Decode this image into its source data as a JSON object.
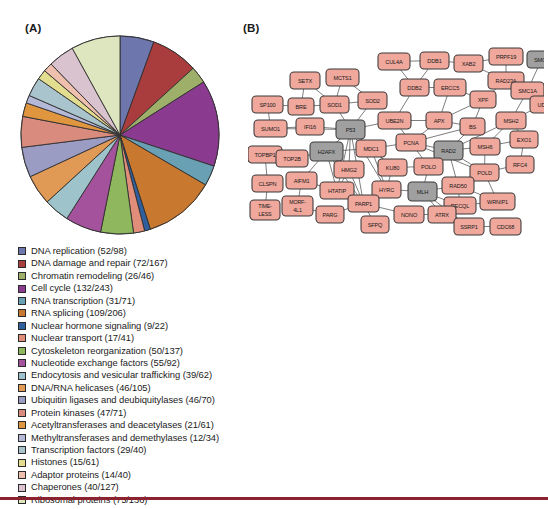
{
  "figure": {
    "panel_a_label": "(A)",
    "panel_b_label": "(B)"
  },
  "chart_data": {
    "type": "pie",
    "title": "",
    "legend_position": "below",
    "categories": [
      "DNA replication (52/98)",
      "DNA damage and repair (72/167)",
      "Chromatin remodeling (26/46)",
      "Cell cycle (132/243)",
      "RNA transcription (31/71)",
      "RNA splicing (109/206)",
      "Nuclear hormone signaling (9/22)",
      "Nuclear transport (17/41)",
      "Cytoskeleton reorganization (50/137)",
      "Nucleotide exchange factors (55/92)",
      "Endocytosis and vesicular trafficking (39/62)",
      "DNA/RNA helicases (46/105)",
      "Ubiquitin ligases and deubiquitylases (46/70)",
      "Protein kinases (47/71)",
      "Acetyltransferases and deacetylases (21/61)",
      "Methyltransferases and demethylases (12/34)",
      "Transcription factors (29/40)",
      "Histones (15/61)",
      "Adaptor proteins (14/40)",
      "Chaperones (40/127)",
      "Ribosomal proteins (75/136)"
    ],
    "values": [
      52,
      72,
      26,
      132,
      31,
      109,
      9,
      17,
      50,
      55,
      39,
      46,
      46,
      47,
      21,
      12,
      29,
      15,
      14,
      40,
      75
    ],
    "totals": [
      98,
      167,
      46,
      243,
      71,
      206,
      22,
      41,
      137,
      92,
      62,
      105,
      70,
      71,
      61,
      34,
      40,
      61,
      40,
      127,
      136
    ],
    "colors": [
      "#6e76ae",
      "#a93c3c",
      "#9eaf69",
      "#8a3b8f",
      "#6aa0b4",
      "#c8792f",
      "#2f5f9e",
      "#e08e7a",
      "#8fb85e",
      "#a3529b",
      "#9ec3ca",
      "#e09a55",
      "#9a9cc4",
      "#d98c7e",
      "#e0953f",
      "#b5b9d8",
      "#a9c4cc",
      "#e3dd90",
      "#efc0ae",
      "#d9c3cf",
      "#dde6be"
    ],
    "xlabel": "",
    "ylabel": ""
  },
  "network": {
    "nodes": [
      {
        "id": "SETX",
        "label": "SETX",
        "x": 42,
        "y": 38,
        "w": 30,
        "h": 17,
        "color": "pink"
      },
      {
        "id": "MCTS1",
        "label": "MCTS1",
        "x": 78,
        "y": 35,
        "w": 33,
        "h": 17,
        "color": "pink"
      },
      {
        "id": "CUL4A",
        "label": "CUL4A",
        "x": 130,
        "y": 19,
        "w": 32,
        "h": 17,
        "color": "pink"
      },
      {
        "id": "DDB1",
        "label": "DDB1",
        "x": 172,
        "y": 18,
        "w": 29,
        "h": 17,
        "color": "pink"
      },
      {
        "id": "XAB2",
        "label": "XAB2",
        "x": 206,
        "y": 21,
        "w": 29,
        "h": 17,
        "color": "pink"
      },
      {
        "id": "PRPF19",
        "label": "PRPF19",
        "x": 241,
        "y": 14,
        "w": 34,
        "h": 17,
        "color": "pink"
      },
      {
        "id": "SMC3",
        "label": "SMC3",
        "x": 279,
        "y": 17,
        "w": 29,
        "h": 17,
        "color": "gray"
      },
      {
        "id": "SP100",
        "label": "SP100",
        "x": 4,
        "y": 62,
        "w": 31,
        "h": 17,
        "color": "pink"
      },
      {
        "id": "BRE",
        "label": "BRE",
        "x": 40,
        "y": 64,
        "w": 26,
        "h": 17,
        "color": "pink"
      },
      {
        "id": "SOD1",
        "label": "SOD1",
        "x": 72,
        "y": 62,
        "w": 29,
        "h": 17,
        "color": "pink"
      },
      {
        "id": "SOD2",
        "label": "SOD2",
        "x": 110,
        "y": 58,
        "w": 29,
        "h": 17,
        "color": "pink"
      },
      {
        "id": "DDB2",
        "label": "DDB2",
        "x": 152,
        "y": 45,
        "w": 29,
        "h": 17,
        "color": "pink"
      },
      {
        "id": "ERCC5",
        "label": "ERCC5",
        "x": 186,
        "y": 45,
        "w": 32,
        "h": 17,
        "color": "pink"
      },
      {
        "id": "XPF",
        "label": "XPF",
        "x": 222,
        "y": 57,
        "w": 26,
        "h": 17,
        "color": "pink"
      },
      {
        "id": "RAD23A",
        "label": "RAD23A",
        "x": 240,
        "y": 38,
        "w": 36,
        "h": 17,
        "color": "pink"
      },
      {
        "id": "SMC1A",
        "label": "SMC1A",
        "x": 263,
        "y": 48,
        "w": 33,
        "h": 17,
        "color": "pink"
      },
      {
        "id": "UDG",
        "label": "UDG",
        "x": 282,
        "y": 62,
        "w": 27,
        "h": 17,
        "color": "pink"
      },
      {
        "id": "SUMO1",
        "label": "SUMO1",
        "x": 6,
        "y": 86,
        "w": 33,
        "h": 17,
        "color": "pink"
      },
      {
        "id": "IFI16",
        "label": "IFI16",
        "x": 48,
        "y": 84,
        "w": 28,
        "h": 17,
        "color": "pink"
      },
      {
        "id": "P53",
        "label": "P53",
        "x": 88,
        "y": 86,
        "w": 29,
        "h": 19,
        "color": "gray"
      },
      {
        "id": "UBE2N",
        "label": "UBE2N",
        "x": 130,
        "y": 78,
        "w": 33,
        "h": 17,
        "color": "pink"
      },
      {
        "id": "APX",
        "label": "APX",
        "x": 178,
        "y": 78,
        "w": 26,
        "h": 17,
        "color": "pink"
      },
      {
        "id": "BS",
        "label": "BS",
        "x": 212,
        "y": 84,
        "w": 25,
        "h": 17,
        "color": "pink"
      },
      {
        "id": "MSH2",
        "label": "MSH2",
        "x": 248,
        "y": 78,
        "w": 30,
        "h": 17,
        "color": "pink"
      },
      {
        "id": "TOPBP1",
        "label": "TOPBP1",
        "x": 0,
        "y": 112,
        "w": 34,
        "h": 17,
        "color": "pink"
      },
      {
        "id": "TOP2B",
        "label": "TOP2B",
        "x": 28,
        "y": 116,
        "w": 32,
        "h": 17,
        "color": "pink"
      },
      {
        "id": "H2AFX",
        "label": "H2AFX",
        "x": 62,
        "y": 108,
        "w": 33,
        "h": 19,
        "color": "gray"
      },
      {
        "id": "MDC1",
        "label": "MDC1",
        "x": 108,
        "y": 106,
        "w": 30,
        "h": 17,
        "color": "pink"
      },
      {
        "id": "PCNA",
        "label": "PCNA",
        "x": 148,
        "y": 100,
        "w": 30,
        "h": 17,
        "color": "pink"
      },
      {
        "id": "RAD2",
        "label": "RAD2",
        "x": 186,
        "y": 107,
        "w": 29,
        "h": 19,
        "color": "gray"
      },
      {
        "id": "MSH6",
        "label": "MSH6",
        "x": 222,
        "y": 104,
        "w": 30,
        "h": 17,
        "color": "pink"
      },
      {
        "id": "EXO1",
        "label": "EXO1",
        "x": 262,
        "y": 97,
        "w": 28,
        "h": 17,
        "color": "pink"
      },
      {
        "id": "RFC4",
        "label": "RFC4",
        "x": 258,
        "y": 122,
        "w": 28,
        "h": 17,
        "color": "pink"
      },
      {
        "id": "HMG2",
        "label": "HMG2",
        "x": 86,
        "y": 127,
        "w": 30,
        "h": 17,
        "color": "pink"
      },
      {
        "id": "KU80",
        "label": "KU80",
        "x": 130,
        "y": 125,
        "w": 29,
        "h": 17,
        "color": "pink"
      },
      {
        "id": "POLO",
        "label": "POLO",
        "x": 166,
        "y": 124,
        "w": 29,
        "h": 17,
        "color": "pink"
      },
      {
        "id": "POLD",
        "label": "POLD",
        "x": 222,
        "y": 130,
        "w": 29,
        "h": 17,
        "color": "pink"
      },
      {
        "id": "CLSPN",
        "label": "CLSPN",
        "x": 4,
        "y": 141,
        "w": 31,
        "h": 17,
        "color": "pink"
      },
      {
        "id": "AIFM1",
        "label": "AIFM1",
        "x": 38,
        "y": 138,
        "w": 31,
        "h": 17,
        "color": "pink"
      },
      {
        "id": "HTATIP",
        "label": "HTATIP",
        "x": 72,
        "y": 148,
        "w": 34,
        "h": 17,
        "color": "pink"
      },
      {
        "id": "HYRC",
        "label": "HYRC",
        "x": 124,
        "y": 147,
        "w": 29,
        "h": 17,
        "color": "pink"
      },
      {
        "id": "MLH",
        "label": "MLH",
        "x": 160,
        "y": 148,
        "w": 29,
        "h": 19,
        "color": "gray"
      },
      {
        "id": "RAD50",
        "label": "RAD50",
        "x": 194,
        "y": 143,
        "w": 32,
        "h": 17,
        "color": "pink"
      },
      {
        "id": "RECQL",
        "label": "RECQL",
        "x": 196,
        "y": 163,
        "w": 32,
        "h": 17,
        "color": "pink"
      },
      {
        "id": "WRNIP1",
        "label": "WRNIP1",
        "x": 232,
        "y": 159,
        "w": 35,
        "h": 17,
        "color": "pink"
      },
      {
        "id": "TIMELESS",
        "label": "TIME-LESS",
        "x": 2,
        "y": 166,
        "w": 30,
        "h": 20,
        "color": "pink"
      },
      {
        "id": "MORF4L1",
        "label": "MORF-4L1",
        "x": 34,
        "y": 162,
        "w": 31,
        "h": 20,
        "color": "pink"
      },
      {
        "id": "PARG",
        "label": "PARG",
        "x": 68,
        "y": 172,
        "w": 28,
        "h": 17,
        "color": "pink"
      },
      {
        "id": "PARP1",
        "label": "PARP1",
        "x": 100,
        "y": 161,
        "w": 31,
        "h": 17,
        "color": "pink"
      },
      {
        "id": "SFPQ",
        "label": "SFPQ",
        "x": 113,
        "y": 182,
        "w": 28,
        "h": 17,
        "color": "pink"
      },
      {
        "id": "NONO",
        "label": "NONO",
        "x": 146,
        "y": 172,
        "w": 30,
        "h": 17,
        "color": "pink"
      },
      {
        "id": "ATRX",
        "label": "ATRX",
        "x": 180,
        "y": 172,
        "w": 28,
        "h": 17,
        "color": "pink"
      },
      {
        "id": "SSRP1",
        "label": "SSRP1",
        "x": 206,
        "y": 184,
        "w": 30,
        "h": 17,
        "color": "pink"
      },
      {
        "id": "CDC68",
        "label": "CDC68",
        "x": 242,
        "y": 184,
        "w": 31,
        "h": 17,
        "color": "pink"
      }
    ],
    "edges": [
      [
        "SETX",
        "SOD1"
      ],
      [
        "MCTS1",
        "SOD1"
      ],
      [
        "MCTS1",
        "SOD2"
      ],
      [
        "SETX",
        "BRE"
      ],
      [
        "SP100",
        "BRE"
      ],
      [
        "SP100",
        "SUMO1"
      ],
      [
        "BRE",
        "SOD1"
      ],
      [
        "SOD1",
        "SOD2"
      ],
      [
        "SOD1",
        "P53"
      ],
      [
        "SOD2",
        "P53"
      ],
      [
        "IFI16",
        "P53"
      ],
      [
        "SUMO1",
        "IFI16"
      ],
      [
        "SUMO1",
        "P53"
      ],
      [
        "CUL4A",
        "DDB1"
      ],
      [
        "CUL4A",
        "DDB2"
      ],
      [
        "DDB1",
        "DDB2"
      ],
      [
        "DDB1",
        "XAB2"
      ],
      [
        "XAB2",
        "PRPF19"
      ],
      [
        "XAB2",
        "RAD23A"
      ],
      [
        "PRPF19",
        "RAD23A"
      ],
      [
        "DDB2",
        "ERCC5"
      ],
      [
        "DDB2",
        "UBE2N"
      ],
      [
        "ERCC5",
        "XPF"
      ],
      [
        "ERCC5",
        "APX"
      ],
      [
        "XPF",
        "APX"
      ],
      [
        "RAD23A",
        "XPF"
      ],
      [
        "SMC3",
        "SMC1A"
      ],
      [
        "SMC1A",
        "UDG"
      ],
      [
        "SMC1A",
        "MSH2"
      ],
      [
        "UDG",
        "MSH2"
      ],
      [
        "XPF",
        "BS"
      ],
      [
        "APX",
        "BS"
      ],
      [
        "APX",
        "PCNA"
      ],
      [
        "BS",
        "PCNA"
      ],
      [
        "BS",
        "RAD2"
      ],
      [
        "MSH2",
        "MSH6"
      ],
      [
        "MSH2",
        "EXO1"
      ],
      [
        "MSH6",
        "EXO1"
      ],
      [
        "MSH2",
        "RAD2"
      ],
      [
        "MSH6",
        "RAD2"
      ],
      [
        "P53",
        "MDC1"
      ],
      [
        "P53",
        "H2AFX"
      ],
      [
        "P53",
        "HMG2"
      ],
      [
        "P53",
        "KU80"
      ],
      [
        "P53",
        "UBE2N"
      ],
      [
        "P53",
        "PARP1"
      ],
      [
        "P53",
        "HTATIP"
      ],
      [
        "P53",
        "HYRC"
      ],
      [
        "H2AFX",
        "MDC1"
      ],
      [
        "H2AFX",
        "HMG2"
      ],
      [
        "H2AFX",
        "TOP2B"
      ],
      [
        "H2AFX",
        "HTATIP"
      ],
      [
        "H2AFX",
        "PARP1"
      ],
      [
        "H2AFX",
        "AIFM1"
      ],
      [
        "TOPBP1",
        "TOP2B"
      ],
      [
        "TOPBP1",
        "CLSPN"
      ],
      [
        "CLSPN",
        "TIMELESS"
      ],
      [
        "AIFM1",
        "MORF4L1"
      ],
      [
        "AIFM1",
        "HTATIP"
      ],
      [
        "MORF4L1",
        "PARG"
      ],
      [
        "PARG",
        "PARP1"
      ],
      [
        "HTATIP",
        "PARP1"
      ],
      [
        "PARP1",
        "SFPQ"
      ],
      [
        "PARP1",
        "HYRC"
      ],
      [
        "PARP1",
        "NONO"
      ],
      [
        "HYRC",
        "MLH"
      ],
      [
        "NONO",
        "ATRX"
      ],
      [
        "MDC1",
        "KU80"
      ],
      [
        "MDC1",
        "PCNA"
      ],
      [
        "KU80",
        "HYRC"
      ],
      [
        "KU80",
        "POLO"
      ],
      [
        "PCNA",
        "POLO"
      ],
      [
        "PCNA",
        "RAD2"
      ],
      [
        "PCNA",
        "POLD"
      ],
      [
        "POLO",
        "MLH"
      ],
      [
        "RAD2",
        "POLD"
      ],
      [
        "RAD2",
        "RAD50"
      ],
      [
        "POLD",
        "RFC4"
      ],
      [
        "POLD",
        "WRNIP1"
      ],
      [
        "MSH6",
        "POLD"
      ],
      [
        "EXO1",
        "RFC4"
      ],
      [
        "MLH",
        "RAD50"
      ],
      [
        "MLH",
        "RECQL"
      ],
      [
        "MLH",
        "ATRX"
      ],
      [
        "RAD50",
        "RECQL"
      ],
      [
        "RAD50",
        "WRNIP1"
      ],
      [
        "RECQL",
        "WRNIP1"
      ],
      [
        "ATRX",
        "SSRP1"
      ],
      [
        "SSRP1",
        "CDC68"
      ],
      [
        "MLH",
        "SSRP1"
      ],
      [
        "HMG2",
        "HTATIP"
      ],
      [
        "UBE2N",
        "APX"
      ],
      [
        "UBE2N",
        "PCNA"
      ],
      [
        "MDC1",
        "HYRC"
      ],
      [
        "HMG2",
        "PARP1"
      ]
    ]
  }
}
